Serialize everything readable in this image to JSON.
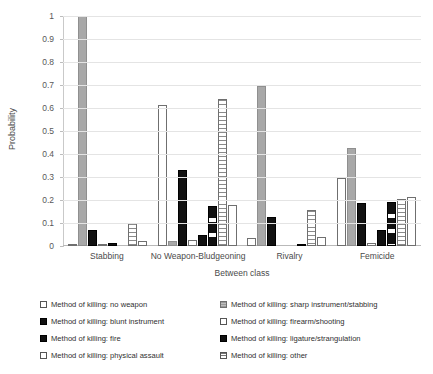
{
  "chart_data": {
    "type": "bar",
    "title": "",
    "xlabel": "Between class",
    "ylabel": "Probability",
    "ylim": [
      0,
      1
    ],
    "yticks": [
      "0",
      "0.1",
      "0.2",
      "0.3",
      "0.4",
      "0.5",
      "0.6",
      "0.7",
      "0.8",
      "0.9",
      "1"
    ],
    "grid": true,
    "legend_position": "bottom",
    "categories": [
      "Stabbing",
      "No Weapon-Bludgeoning",
      "Rivalry",
      "Femicide"
    ],
    "series": [
      {
        "name": "Method of killing: no weapon",
        "pattern": "open",
        "values": [
          0.005,
          0.615,
          0.035,
          0.295
        ]
      },
      {
        "name": "Method of killing: sharp instrument/stabbing",
        "pattern": "gray",
        "values": [
          1.0,
          0.02,
          0.695,
          0.425
        ]
      },
      {
        "name": "Method of killing: blunt instrument",
        "pattern": "black",
        "values": [
          0.07,
          0.33,
          0.125,
          0.185
        ]
      },
      {
        "name": "Method of killing: firearm/shooting",
        "pattern": "open",
        "values": [
          0.005,
          0.025,
          0.0,
          0.015
        ]
      },
      {
        "name": "Method of killing: fire",
        "pattern": "black",
        "values": [
          0.015,
          0.05,
          0.0,
          0.07
        ]
      },
      {
        "name": "Method of killing: ligature/strangulation",
        "pattern": "dash",
        "values": [
          0.0,
          0.175,
          0.01,
          0.19
        ]
      },
      {
        "name": "Method of killing: physical assault",
        "pattern": "hatch",
        "values": [
          0.1,
          0.64,
          0.155,
          0.205
        ]
      },
      {
        "name": "Method of killing: other",
        "pattern": "open",
        "values": [
          0.02,
          0.18,
          0.04,
          0.215
        ]
      }
    ]
  },
  "legend": {
    "items": [
      {
        "label": "Method of killing: no weapon",
        "swatch": "open"
      },
      {
        "label": "Method of killing: sharp instrument/stabbing",
        "swatch": "gray"
      },
      {
        "label": "Method of killing: blunt instrument",
        "swatch": "black"
      },
      {
        "label": "Method of killing: firearm/shooting",
        "swatch": "open"
      },
      {
        "label": "Method of killing: fire",
        "swatch": "black"
      },
      {
        "label": "Method of killing: ligature/strangulation",
        "swatch": "dash"
      },
      {
        "label": "Method of killing: physical assault",
        "swatch": "open"
      },
      {
        "label": "Method of killing: other",
        "swatch": "hatch"
      }
    ]
  },
  "colors": {
    "gridline": "#e4e4e4",
    "axis": "#bdbdbd",
    "text": "#4a4a4a",
    "bar_gray": "#a8a8a8",
    "bar_black": "#111111",
    "bar_outline": "#6f6f6f"
  }
}
